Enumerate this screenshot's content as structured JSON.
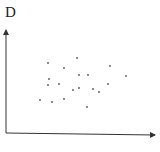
{
  "chart_data": {
    "type": "scatter",
    "title": "",
    "xlabel": "",
    "ylabel": "D",
    "grid": false,
    "legend": null,
    "axis_style": "arrows, no ticks",
    "pixel_frame": {
      "origin_x": 6,
      "origin_y": 133,
      "x_end": 155,
      "y_end": 30
    },
    "points": [
      {
        "x": 48,
        "y": 63
      },
      {
        "x": 77,
        "y": 58
      },
      {
        "x": 64,
        "y": 68
      },
      {
        "x": 110,
        "y": 66
      },
      {
        "x": 126,
        "y": 76
      },
      {
        "x": 79,
        "y": 75
      },
      {
        "x": 88,
        "y": 75
      },
      {
        "x": 49,
        "y": 79
      },
      {
        "x": 48,
        "y": 85
      },
      {
        "x": 59,
        "y": 84
      },
      {
        "x": 108,
        "y": 84
      },
      {
        "x": 73,
        "y": 90
      },
      {
        "x": 79,
        "y": 88
      },
      {
        "x": 93,
        "y": 89
      },
      {
        "x": 99,
        "y": 92
      },
      {
        "x": 40,
        "y": 100
      },
      {
        "x": 52,
        "y": 102
      },
      {
        "x": 64,
        "y": 99
      },
      {
        "x": 87,
        "y": 107
      }
    ],
    "colors": {
      "axis": "#333333",
      "point": "#555555"
    }
  }
}
